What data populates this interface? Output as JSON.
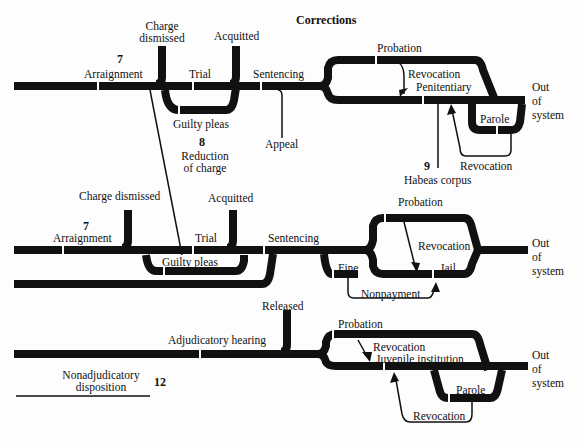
{
  "header": {
    "section_title": "Corrections"
  },
  "adult_felony": {
    "step_number": "7",
    "arraignment": "Arraignment",
    "charge_dismissed": "Charge dismissed",
    "acquitted": "Acquitted",
    "trial": "Trial",
    "guilty_pleas": "Guilty pleas",
    "sentencing": "Sentencing",
    "appeal": "Appeal",
    "reduction_number": "8",
    "reduction_label_1": "Reduction",
    "reduction_label_2": "of charge",
    "probation": "Probation",
    "revocation_probation": "Revocation",
    "penitentiary": "Penitentiary",
    "parole": "Parole",
    "revocation_parole": "Revocation",
    "habeas_number": "9",
    "habeas_corpus": "Habeas corpus",
    "out_of_system": [
      "Out",
      "of",
      "system"
    ]
  },
  "misdemeanor": {
    "step_number": "7",
    "arraignment": "Arraignment",
    "charge_dismissed": "Charge dismissed",
    "acquitted": "Acquitted",
    "trial": "Trial",
    "guilty_pleas": "Guilty pleas",
    "sentencing": "Sentencing",
    "probation": "Probation",
    "revocation": "Revocation",
    "jail": "Jail",
    "fine": "Fine",
    "nonpayment": "Nonpayment",
    "out_of_system": [
      "Out",
      "of",
      "system"
    ]
  },
  "juvenile": {
    "released": "Released",
    "adjudicatory_hearing": "Adjudicatory hearing",
    "nonadjudicatory_1": "Nonadjudicatory",
    "nonadjudicatory_2": "disposition",
    "step_number": "12",
    "probation": "Probation",
    "revocation_probation": "Revocation",
    "juvenile_institution": "Juvenile institution",
    "parole": "Parole",
    "revocation_parole": "Revocation",
    "out_of_system": [
      "Out",
      "of",
      "system"
    ]
  }
}
